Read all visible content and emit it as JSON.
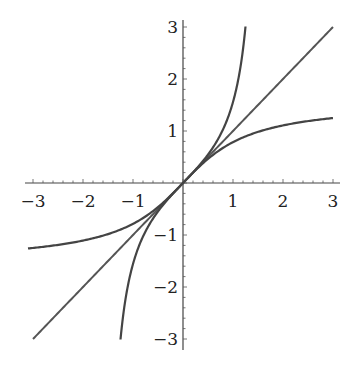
{
  "chart_data": {
    "type": "line",
    "title": "",
    "xlabel": "",
    "ylabel": "",
    "xlim": [
      -3.1,
      3.1
    ],
    "ylim": [
      -3.1,
      3.1
    ],
    "grid": false,
    "legend": null,
    "x_ticks": [
      "-3",
      "-2",
      "-1",
      "1",
      "2",
      "3"
    ],
    "y_ticks": [
      "3",
      "2",
      "1",
      "-1",
      "-2",
      "-3"
    ],
    "series": [
      {
        "name": "tan(x)",
        "function": "tan",
        "domain": [
          -1.25,
          1.25
        ]
      },
      {
        "name": "y = x",
        "function": "identity",
        "domain": [
          -3,
          3
        ]
      },
      {
        "name": "arctan(x)",
        "function": "arctan",
        "domain": [
          -3.1,
          3
        ]
      }
    ]
  },
  "labels": {
    "x": {
      "m3": "−3",
      "m2": "−2",
      "m1": "−1",
      "p1": "1",
      "p2": "2",
      "p3": "3"
    },
    "y": {
      "p3": "3",
      "p2": "2",
      "p1": "1",
      "m1": "−1",
      "m2": "−2",
      "m3": "−3"
    }
  }
}
